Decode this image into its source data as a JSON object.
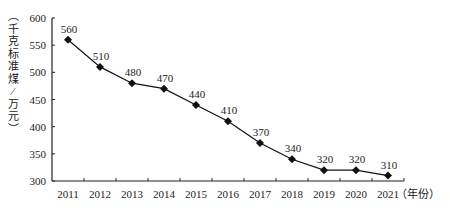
{
  "chart_data": {
    "type": "line",
    "title": "",
    "xlabel": "（年份）",
    "ylabel": "（千克标准煤/万元）",
    "categories": [
      "2011",
      "2012",
      "2013",
      "2014",
      "2015",
      "2016",
      "2017",
      "2018",
      "2019",
      "2020",
      "2021"
    ],
    "series": [
      {
        "name": "能耗",
        "values": [
          560,
          510,
          480,
          470,
          440,
          410,
          370,
          340,
          320,
          320,
          310
        ]
      }
    ],
    "ylim": [
      300,
      600
    ],
    "yticks": [
      300,
      350,
      400,
      450,
      500,
      550,
      600
    ],
    "grid": false,
    "legend": "none",
    "marker": "diamond",
    "colors": {
      "line": "#111111",
      "axis": "#222222"
    }
  }
}
